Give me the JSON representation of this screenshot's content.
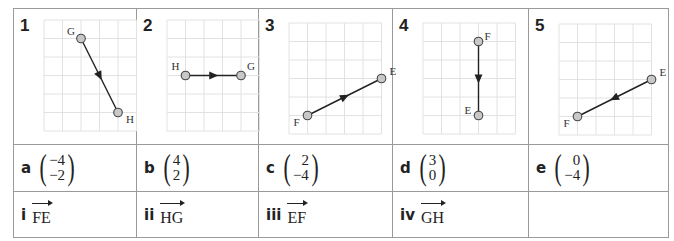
{
  "grids": [
    {
      "number": "1",
      "start": {
        "label": "G",
        "x": 2,
        "y": 5
      },
      "end": {
        "label": "H",
        "x": 4,
        "y": 1
      },
      "vector": [
        2,
        -4
      ]
    },
    {
      "number": "2",
      "start": {
        "label": "H",
        "x": 1,
        "y": 3
      },
      "end": {
        "label": "G",
        "x": 4,
        "y": 3
      },
      "vector": [
        3,
        0
      ]
    },
    {
      "number": "3",
      "start": {
        "label": "F",
        "x": 1,
        "y": 1
      },
      "end": {
        "label": "E",
        "x": 5,
        "y": 3
      },
      "vector": [
        4,
        2
      ]
    },
    {
      "number": "4",
      "start": {
        "label": "F",
        "x": 3,
        "y": 5
      },
      "end": {
        "label": "E",
        "x": 3,
        "y": 1
      },
      "vector": [
        0,
        -4
      ]
    },
    {
      "number": "5",
      "start": {
        "label": "E",
        "x": 5,
        "y": 3
      },
      "end": {
        "label": "F",
        "x": 1,
        "y": 1
      },
      "vector": [
        -4,
        -2
      ]
    }
  ],
  "column_vectors": [
    {
      "label": "a",
      "top": "−4",
      "bottom": "−2"
    },
    {
      "label": "b",
      "top": "4",
      "bottom": "2"
    },
    {
      "label": "c",
      "top": "2",
      "bottom": "−4"
    },
    {
      "label": "d",
      "top": "3",
      "bottom": "0"
    },
    {
      "label": "e",
      "top": "0",
      "bottom": "−4"
    }
  ],
  "vector_names": [
    {
      "label": "i",
      "name": "FE"
    },
    {
      "label": "ii",
      "name": "HG"
    },
    {
      "label": "iii",
      "name": "EF"
    },
    {
      "label": "iv",
      "name": "GH"
    },
    {
      "label": "",
      "name": ""
    }
  ],
  "colors": {
    "grid": "#e2e2e2",
    "border": "#9a9a9a",
    "point_fill": "#c8c8c8",
    "line": "#222222"
  }
}
